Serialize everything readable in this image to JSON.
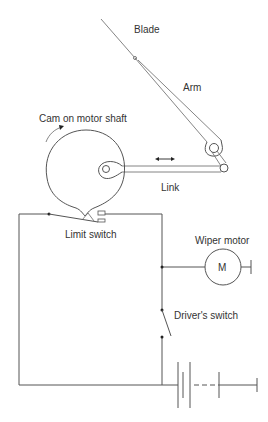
{
  "diagram": {
    "labels": {
      "blade": "Blade",
      "arm": "Arm",
      "cam": "Cam on motor shaft",
      "link": "Link",
      "limit_switch": "Limit switch",
      "wiper_motor": "Wiper motor",
      "motor_symbol": "M",
      "drivers_switch": "Driver's switch"
    },
    "components": [
      {
        "id": "blade",
        "type": "mechanical"
      },
      {
        "id": "arm",
        "type": "mechanical"
      },
      {
        "id": "cam",
        "type": "mechanical",
        "rotation": "clockwise"
      },
      {
        "id": "link",
        "type": "mechanical",
        "motion": "reciprocating"
      },
      {
        "id": "limit_switch",
        "type": "switch"
      },
      {
        "id": "wiper_motor",
        "type": "motor"
      },
      {
        "id": "drivers_switch",
        "type": "switch",
        "state": "open"
      },
      {
        "id": "battery",
        "type": "battery"
      }
    ],
    "colors": {
      "line": "#555555",
      "text": "#333333",
      "background": "#ffffff"
    }
  }
}
